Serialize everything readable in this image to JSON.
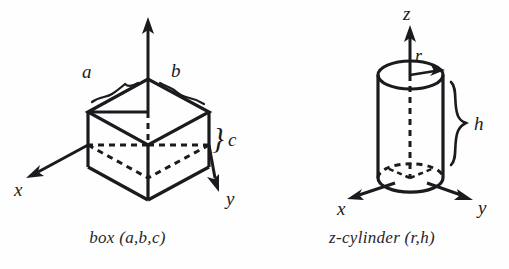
{
  "page": {
    "background_color": "#fefefe",
    "ink_color": "#1a1a1f",
    "width": 509,
    "height": 269
  },
  "figures": [
    {
      "id": "box",
      "shape": "box",
      "caption": "box (a,b,c)",
      "axis_labels": {
        "x": "x",
        "y": "y",
        "z": ""
      },
      "dimension_labels": {
        "a": "a",
        "b": "b",
        "c": "c"
      },
      "brace_glyph": "}",
      "parameters": [
        "a",
        "b",
        "c"
      ]
    },
    {
      "id": "cylinder",
      "shape": "z-cylinder",
      "caption": "z-cylinder (r,h)",
      "axis_labels": {
        "x": "x",
        "y": "y",
        "z": "z"
      },
      "dimension_labels": {
        "r": "r",
        "h": "h"
      },
      "brace_glyph": "}",
      "parameters": [
        "r",
        "h"
      ]
    }
  ]
}
